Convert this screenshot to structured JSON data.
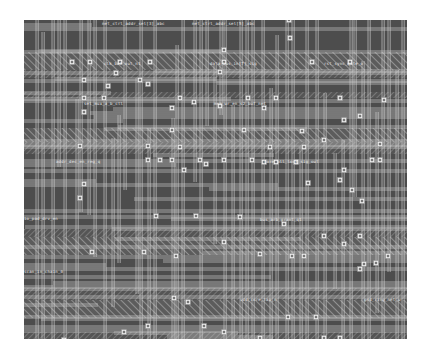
{
  "diagram": {
    "type": "ic-layout-routing",
    "background_color": "#4d4d4d",
    "wire_color": "#d8d8d8",
    "via_color": "#eeeeee",
    "hatch_color": "#9a9a9a",
    "region": {
      "x": 24,
      "y": 20,
      "width": 383,
      "height": 319
    }
  },
  "labels": [
    {
      "text": "net_ctrl_addr_sel[3]_abc",
      "x": 78,
      "y": 2
    },
    {
      "text": "net_ctrl_addr_sel[5]_abc",
      "x": 168,
      "y": 2
    },
    {
      "text": "clk_buf_out_n1",
      "x": 80,
      "y": 42
    },
    {
      "text": "data_bus_in[7]_sig",
      "x": 186,
      "y": 42
    },
    {
      "text": "rst_sync_gate_o",
      "x": 300,
      "y": 42
    },
    {
      "text": "sel_mux_a_b_ctl",
      "x": 60,
      "y": 82
    },
    {
      "text": "addr_dec_en_reg_q",
      "x": 32,
      "y": 140
    },
    {
      "text": "mem_wr_en_s2_buf_net",
      "x": 190,
      "y": 82
    },
    {
      "text": "core_pll_lock_sig_out",
      "x": 240,
      "y": 140
    },
    {
      "text": "io_pad_drv_en",
      "x": 0,
      "y": 197
    },
    {
      "text": "bus_arb_grant_q1",
      "x": 236,
      "y": 198
    },
    {
      "text": "scan_in_chain_0",
      "x": 0,
      "y": 250
    },
    {
      "text": "vdd_core_tap_n",
      "x": 216,
      "y": 278
    },
    {
      "text": "gnd_ring_net_w",
      "x": 340,
      "y": 278
    }
  ],
  "vias": [
    [
      266,
      18
    ],
    [
      288,
      42
    ],
    [
      265,
      0
    ],
    [
      48,
      42
    ],
    [
      66,
      42
    ],
    [
      96,
      42
    ],
    [
      126,
      42
    ],
    [
      200,
      30
    ],
    [
      200,
      42
    ],
    [
      326,
      42
    ],
    [
      196,
      52
    ],
    [
      92,
      53
    ],
    [
      60,
      60
    ],
    [
      116,
      60
    ],
    [
      156,
      78
    ],
    [
      170,
      82
    ],
    [
      60,
      78
    ],
    [
      80,
      78
    ],
    [
      224,
      78
    ],
    [
      252,
      78
    ],
    [
      316,
      78
    ],
    [
      196,
      86
    ],
    [
      148,
      88
    ],
    [
      240,
      88
    ],
    [
      60,
      92
    ],
    [
      84,
      66
    ],
    [
      336,
      96
    ],
    [
      360,
      80
    ],
    [
      320,
      100
    ],
    [
      124,
      64
    ],
    [
      148,
      110
    ],
    [
      220,
      110
    ],
    [
      278,
      111
    ],
    [
      56,
      126
    ],
    [
      124,
      126
    ],
    [
      156,
      127
    ],
    [
      246,
      127
    ],
    [
      280,
      127
    ],
    [
      300,
      120
    ],
    [
      160,
      150
    ],
    [
      124,
      140
    ],
    [
      136,
      140
    ],
    [
      148,
      140
    ],
    [
      176,
      140
    ],
    [
      200,
      140
    ],
    [
      228,
      140
    ],
    [
      240,
      142
    ],
    [
      252,
      142
    ],
    [
      272,
      142
    ],
    [
      320,
      150
    ],
    [
      348,
      140
    ],
    [
      356,
      140
    ],
    [
      316,
      160
    ],
    [
      182,
      144
    ],
    [
      60,
      164
    ],
    [
      284,
      163
    ],
    [
      328,
      170
    ],
    [
      338,
      181
    ],
    [
      356,
      124
    ],
    [
      56,
      178
    ],
    [
      132,
      196
    ],
    [
      172,
      196
    ],
    [
      216,
      197
    ],
    [
      260,
      204
    ],
    [
      300,
      216
    ],
    [
      336,
      216
    ],
    [
      68,
      232
    ],
    [
      120,
      232
    ],
    [
      152,
      236
    ],
    [
      200,
      222
    ],
    [
      236,
      234
    ],
    [
      268,
      236
    ],
    [
      280,
      236
    ],
    [
      320,
      224
    ],
    [
      340,
      244
    ],
    [
      352,
      243
    ],
    [
      364,
      236
    ],
    [
      150,
      278
    ],
    [
      164,
      282
    ],
    [
      292,
      297
    ],
    [
      264,
      297
    ],
    [
      336,
      249
    ],
    [
      40,
      320
    ],
    [
      124,
      306
    ],
    [
      100,
      312
    ],
    [
      180,
      306
    ],
    [
      200,
      312
    ],
    [
      236,
      318
    ],
    [
      300,
      318
    ],
    [
      316,
      318
    ],
    [
      300,
      336
    ]
  ]
}
